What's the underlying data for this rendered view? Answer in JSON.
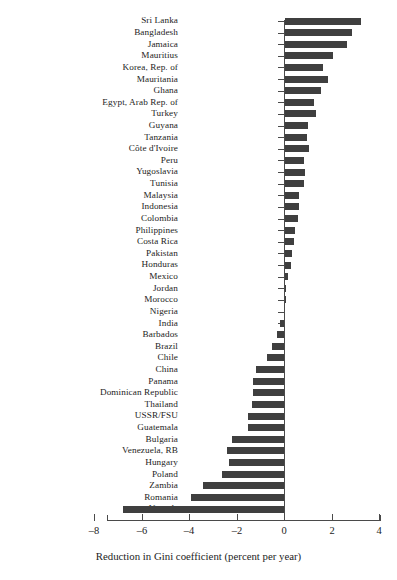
{
  "chart_data": {
    "type": "bar",
    "orientation": "horizontal",
    "title": "",
    "xlabel": "Reduction in Gini coefficient (percent per year)",
    "ylabel": "",
    "xlim": [
      -8,
      4
    ],
    "xticks": [
      -8,
      -6,
      -4,
      -2,
      0,
      2,
      4
    ],
    "xtick_labels": [
      "–8",
      "–6",
      "–4",
      "–2",
      "0",
      "2",
      "4"
    ],
    "grid": false,
    "legend": null,
    "bar_color": "#3f3f3f",
    "axis_color": "#4a4a4a",
    "categories": [
      "Sri Lanka",
      "Bangladesh",
      "Jamaica",
      "Mauritius",
      "Korea, Rep. of",
      "Mauritania",
      "Ghana",
      "Egypt, Arab Rep. of",
      "Turkey",
      "Guyana",
      "Tanzania",
      "Côte d'Ivoire",
      "Peru",
      "Yugoslavia",
      "Tunisia",
      "Malaysia",
      "Indonesia",
      "Colombia",
      "Philippines",
      "Costa Rica",
      "Pakistan",
      "Honduras",
      "Mexico",
      "Jordan",
      "Morocco",
      "Nigeria",
      "India",
      "Barbados",
      "Brazil",
      "Chile",
      "China",
      "Panama",
      "Dominican Republic",
      "Thailand",
      "USSR/FSU",
      "Guatemala",
      "Bulgaria",
      "Venezuela, RB",
      "Hungary",
      "Poland",
      "Zambia",
      "Romania",
      "Uganda"
    ],
    "values": [
      3.2,
      2.8,
      2.6,
      2.0,
      1.6,
      1.8,
      1.5,
      1.2,
      1.3,
      0.97,
      0.93,
      1.0,
      0.8,
      0.85,
      0.8,
      0.6,
      0.6,
      0.55,
      0.42,
      0.38,
      0.3,
      0.25,
      0.12,
      0.04,
      0.02,
      -0.02,
      -0.15,
      -0.3,
      -0.5,
      -0.7,
      -1.2,
      -1.3,
      -1.3,
      -1.35,
      -1.5,
      -1.5,
      -2.2,
      -2.4,
      -2.3,
      -2.6,
      -3.4,
      -3.9,
      -6.8
    ]
  }
}
